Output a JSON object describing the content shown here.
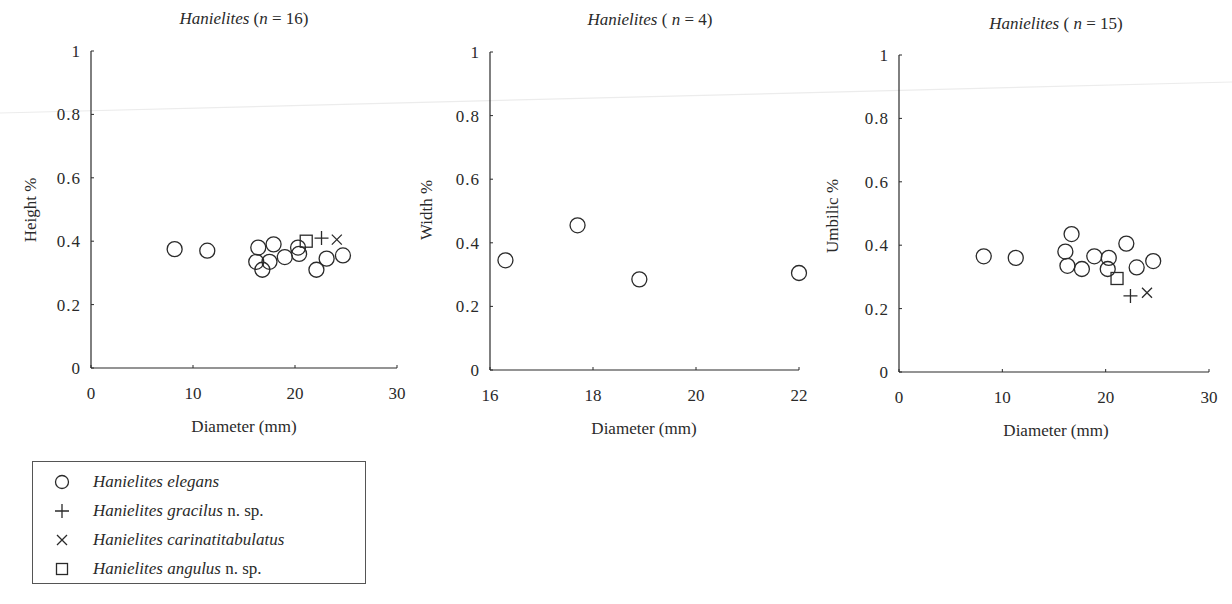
{
  "figure": {
    "legend": {
      "items": [
        {
          "marker": "circle",
          "genus": "Hanielites",
          "species": "elegans",
          "suffix": ""
        },
        {
          "marker": "plus",
          "genus": "Hanielites",
          "species": "gracilus",
          "suffix": " n. sp."
        },
        {
          "marker": "cross",
          "genus": "Hanielites",
          "species": "carinatitabulatus",
          "suffix": ""
        },
        {
          "marker": "square",
          "genus": "Hanielites",
          "species": "angulus",
          "suffix": " n. sp."
        }
      ]
    },
    "colors": {
      "ink": "#2a2a2a",
      "background": "#ffffff",
      "artifact_line": "#e6e6e6"
    }
  },
  "chart_data": [
    {
      "type": "scatter",
      "title": "Hanielites (n = 16)",
      "title_genus": "Hanielites",
      "title_n": "16",
      "xlabel": "Diameter (mm)",
      "ylabel": "Height %",
      "xlim": [
        0,
        30
      ],
      "ylim": [
        0,
        1
      ],
      "xticks": [
        "0",
        "10",
        "20",
        "30"
      ],
      "yticks": [
        "0",
        "0.2",
        "0.4",
        "0.6",
        "0.8",
        "1"
      ],
      "grid": false,
      "series": [
        {
          "name": "Hanielites elegans",
          "marker": "circle",
          "points": [
            [
              8.2,
              0.375
            ],
            [
              11.4,
              0.37
            ],
            [
              16.4,
              0.38
            ],
            [
              16.2,
              0.335
            ],
            [
              16.8,
              0.31
            ],
            [
              17.5,
              0.335
            ],
            [
              17.9,
              0.39
            ],
            [
              19.0,
              0.35
            ],
            [
              20.3,
              0.38
            ],
            [
              20.4,
              0.36
            ],
            [
              22.1,
              0.31
            ],
            [
              23.1,
              0.345
            ],
            [
              24.7,
              0.355
            ]
          ]
        },
        {
          "name": "Hanielites gracilus n. sp.",
          "marker": "plus",
          "points": [
            [
              22.6,
              0.41
            ]
          ]
        },
        {
          "name": "Hanielites carinatitabulatus",
          "marker": "cross",
          "points": [
            [
              24.1,
              0.405
            ]
          ]
        },
        {
          "name": "Hanielites angulus n. sp.",
          "marker": "square",
          "points": [
            [
              21.1,
              0.4
            ]
          ]
        }
      ]
    },
    {
      "type": "scatter",
      "title": "Hanielites ( n = 4)",
      "title_genus": "Hanielites",
      "title_n": "4",
      "xlabel": "Diameter (mm)",
      "ylabel": "Width %",
      "xlim": [
        16,
        22
      ],
      "ylim": [
        0,
        1
      ],
      "xticks": [
        "16",
        "18",
        "20",
        "22"
      ],
      "yticks": [
        "0",
        "0.2",
        "0.4",
        "0.6",
        "0.8",
        "1"
      ],
      "grid": false,
      "series": [
        {
          "name": "Hanielites elegans",
          "marker": "circle",
          "points": [
            [
              16.3,
              0.345
            ],
            [
              17.7,
              0.455
            ],
            [
              18.9,
              0.285
            ],
            [
              22.0,
              0.305
            ]
          ]
        }
      ]
    },
    {
      "type": "scatter",
      "title": "Hanielites ( n = 15)",
      "title_genus": "Hanielites",
      "title_n": "15",
      "xlabel": "Diameter (mm)",
      "ylabel": "Umbilic %",
      "xlim": [
        0,
        30
      ],
      "ylim": [
        0,
        1
      ],
      "xticks": [
        "0",
        "10",
        "20",
        "30"
      ],
      "yticks": [
        "0",
        "0.2",
        "0.4",
        "0.6",
        "0.8",
        "1"
      ],
      "grid": false,
      "series": [
        {
          "name": "Hanielites elegans",
          "marker": "circle",
          "points": [
            [
              8.2,
              0.365
            ],
            [
              11.3,
              0.36
            ],
            [
              16.1,
              0.38
            ],
            [
              16.7,
              0.435
            ],
            [
              16.3,
              0.335
            ],
            [
              17.7,
              0.325
            ],
            [
              18.9,
              0.365
            ],
            [
              20.3,
              0.36
            ],
            [
              20.2,
              0.325
            ],
            [
              22.0,
              0.405
            ],
            [
              23.0,
              0.33
            ],
            [
              24.6,
              0.35
            ]
          ]
        },
        {
          "name": "Hanielites gracilus n. sp.",
          "marker": "plus",
          "points": [
            [
              22.4,
              0.24
            ]
          ]
        },
        {
          "name": "Hanielites carinatitabulatus",
          "marker": "cross",
          "points": [
            [
              24.0,
              0.25
            ]
          ]
        },
        {
          "name": "Hanielites angulus n. sp.",
          "marker": "square",
          "points": [
            [
              21.1,
              0.295
            ]
          ]
        }
      ]
    }
  ]
}
